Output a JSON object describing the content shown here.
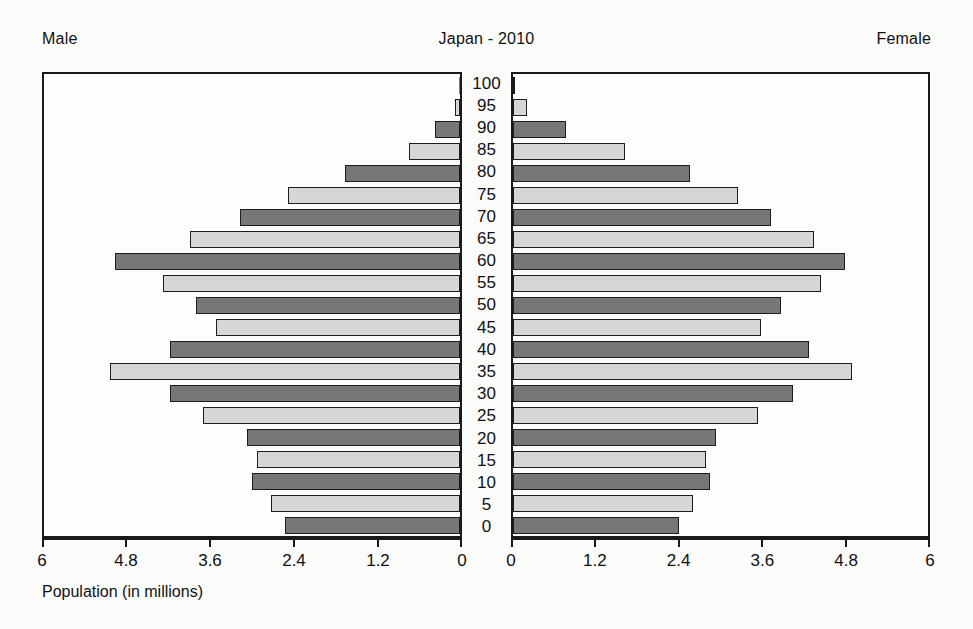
{
  "header": {
    "male_label": "Male",
    "female_label": "Female",
    "title": "Japan - 2010"
  },
  "axis": {
    "caption": "Population (in millions)",
    "ticks": [
      "6",
      "4.8",
      "3.6",
      "2.4",
      "1.2",
      "0"
    ],
    "tick_values": [
      6,
      4.8,
      3.6,
      2.4,
      1.2,
      0
    ],
    "max": 6
  },
  "chart_data": {
    "type": "bar",
    "subtype": "population-pyramid",
    "title": "Japan - 2010",
    "xlabel": "Population (in millions)",
    "ylabel": "",
    "xlim": [
      0,
      6
    ],
    "xticks": [
      0,
      1.2,
      2.4,
      3.6,
      4.8,
      6
    ],
    "grid": false,
    "legend_position": "top-left-and-top-right",
    "categories": [
      "100",
      "95",
      "90",
      "85",
      "80",
      "75",
      "70",
      "65",
      "60",
      "55",
      "50",
      "45",
      "40",
      "35",
      "30",
      "25",
      "20",
      "15",
      "10",
      "5",
      "0"
    ],
    "series": [
      {
        "name": "Male",
        "direction": "left",
        "values": [
          0.01,
          0.07,
          0.37,
          0.74,
          1.67,
          2.5,
          3.21,
          3.94,
          5.02,
          4.32,
          3.85,
          3.55,
          4.22,
          5.1,
          4.22,
          3.75,
          3.1,
          2.96,
          3.03,
          2.76,
          2.55
        ]
      },
      {
        "name": "Female",
        "direction": "right",
        "values": [
          0.03,
          0.21,
          0.77,
          1.64,
          2.58,
          3.28,
          3.77,
          4.39,
          4.85,
          4.49,
          3.91,
          3.62,
          4.32,
          4.95,
          4.08,
          3.57,
          2.96,
          2.82,
          2.88,
          2.62,
          2.42
        ]
      }
    ]
  }
}
